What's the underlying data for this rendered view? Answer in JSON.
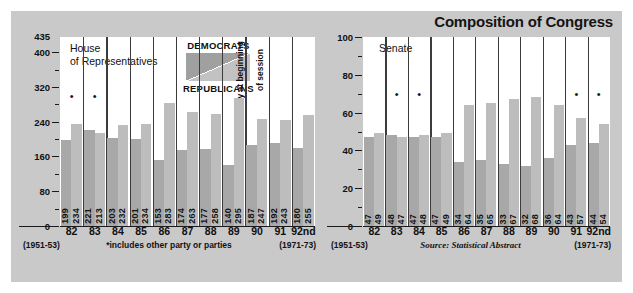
{
  "chart_data": {
    "type": "bar",
    "title": "Composition of Congress",
    "legend": {
      "position": "inside-top-center-house",
      "top_label": "DEMOCRATS",
      "bottom_label": "REPUBLICANS",
      "entries": [
        "DEMOCRATS",
        "REPUBLICANS"
      ]
    },
    "annotations": {
      "vacancy_note_line1": "†vacancy at beginning",
      "vacancy_note_line2": "of session",
      "asterisk_note": "*includes other party or parties",
      "source": "Source: Statistical Abstract",
      "range_start": "(1951-53)",
      "range_end": "(1971-73)"
    },
    "categories": [
      "82",
      "83",
      "84",
      "85",
      "86",
      "87",
      "88",
      "89",
      "90",
      "91",
      "92nd"
    ],
    "panels": [
      {
        "name": "house",
        "label": "House\nof Representatives",
        "label_line1": "House",
        "label_line2": "of Representatives",
        "ylabel": "",
        "xlabel": "",
        "ylim": [
          0,
          435
        ],
        "yticks": [
          0,
          80,
          160,
          240,
          320,
          400
        ],
        "ytick_labels": [
          "0",
          "80",
          "160",
          "240",
          "320",
          "400"
        ],
        "ytop_label": "435",
        "yminor_step": 40,
        "grid": false,
        "series": [
          {
            "name": "DEMOCRATS",
            "color": "#a8a8a8",
            "values": [
              199,
              221,
              203,
              201,
              153,
              174,
              177,
              140,
              187,
              192,
              180
            ]
          },
          {
            "name": "REPUBLICANS",
            "color": "#bdbdbd",
            "values": [
              234,
              213,
              232,
              234,
              283,
              263,
              258,
              295,
              247,
              243,
              255
            ]
          }
        ],
        "asterisk_categories": [
          "82",
          "83"
        ],
        "asterisk_y": 300,
        "dagger_category": "90"
      },
      {
        "name": "senate",
        "label": "Senate",
        "label_line1": "Senate",
        "ylabel": "",
        "xlabel": "",
        "ylim": [
          0,
          100
        ],
        "yticks": [
          0,
          20,
          40,
          60,
          80,
          100
        ],
        "ytick_labels": [
          "0",
          "20",
          "40",
          "60",
          "80",
          "100"
        ],
        "yminor_step": 10,
        "grid": false,
        "series": [
          {
            "name": "DEMOCRATS",
            "color": "#a8a8a8",
            "values": [
              47,
              48,
              47,
              47,
              34,
              35,
              33,
              32,
              36,
              43,
              44
            ]
          },
          {
            "name": "REPUBLICANS",
            "color": "#bdbdbd",
            "values": [
              49,
              47,
              48,
              49,
              64,
              65,
              67,
              68,
              64,
              57,
              54
            ]
          }
        ],
        "asterisk_categories": [
          "83",
          "84",
          "91",
          "92nd"
        ],
        "asterisk_y": 70
      }
    ],
    "colors": {
      "panel_background": "#c9c9c9",
      "plot_background": "#ffffff",
      "democrat_bar": "#a8a8a8",
      "republican_bar": "#bdbdbd",
      "text": "#111111"
    }
  }
}
